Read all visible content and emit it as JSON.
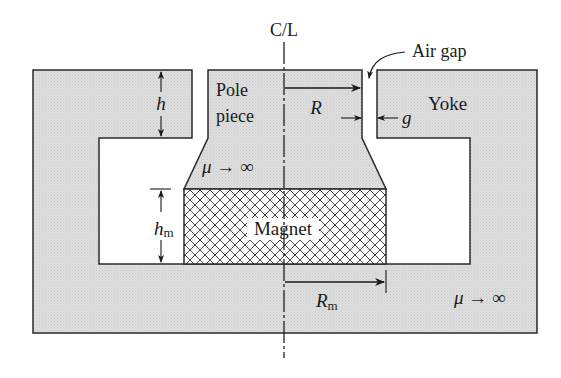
{
  "colors": {
    "iron_fill": "#dcdcdc",
    "outline": "#2a2a2a",
    "magnet_hatch": "#333333",
    "background": "#ffffff"
  },
  "labels": {
    "centerline": "C/L",
    "air_gap": "Air gap",
    "pole_piece_line1": "Pole",
    "pole_piece_line2": "piece",
    "yoke": "Yoke",
    "magnet": "Magnet",
    "mu_pole": "μ → ∞",
    "mu_yoke": "μ → ∞",
    "h": "h",
    "h_m": "h",
    "h_m_sub": "m",
    "R": "R",
    "R_m": "R",
    "R_m_sub": "m",
    "g": "g"
  },
  "dimensions": [
    {
      "symbol": "h",
      "meaning": "yoke top-plate thickness"
    },
    {
      "symbol": "h_m",
      "meaning": "magnet height"
    },
    {
      "symbol": "R",
      "meaning": "pole piece radius"
    },
    {
      "symbol": "R_m",
      "meaning": "magnet radius"
    },
    {
      "symbol": "g",
      "meaning": "air gap width"
    }
  ]
}
